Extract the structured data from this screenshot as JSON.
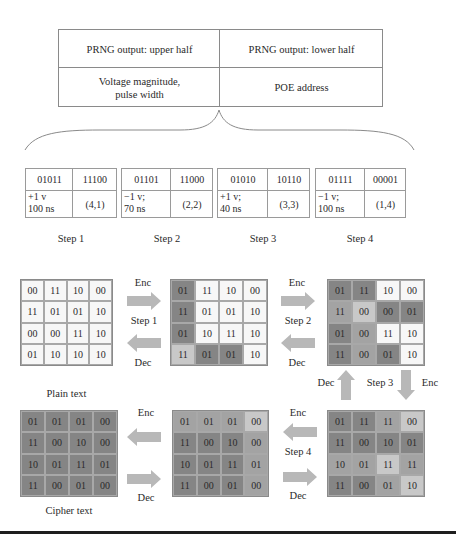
{
  "top_table": {
    "header": [
      "PRNG output: upper half",
      "PRNG output: lower half"
    ],
    "row": [
      "Voltage magnitude, pulse width",
      "POE address"
    ],
    "row_lines": [
      [
        "Voltage magnitude,",
        "pulse width"
      ],
      [
        "POE address"
      ]
    ]
  },
  "steps": [
    {
      "label": "Step 1",
      "upper": "01011",
      "lower": "11100",
      "voltage": "+1 v",
      "width": "100 ns",
      "address": "(4,1)"
    },
    {
      "label": "Step 2",
      "upper": "01101",
      "lower": "11000",
      "voltage": "−1 v;",
      "width": "70 ns",
      "address": "(2,2)"
    },
    {
      "label": "Step 3",
      "upper": "01010",
      "lower": "10110",
      "voltage": "+1 v;",
      "width": "40 ns",
      "address": "(3,3)"
    },
    {
      "label": "Step 4",
      "upper": "01111",
      "lower": "00001",
      "voltage": "−1 v;",
      "width": "100 ns",
      "address": "(1,4)"
    }
  ],
  "colors": {
    "white": "#f7f7f7",
    "light": "#c8c8c8",
    "mid": "#a3a3a3",
    "dark": "#858585",
    "arrow": "#b8b8b8",
    "border": "#8a8a8a"
  },
  "grids": {
    "plain": {
      "label": "Plain text",
      "values": [
        [
          "00",
          "11",
          "10",
          "00"
        ],
        [
          "11",
          "01",
          "01",
          "10"
        ],
        [
          "00",
          "00",
          "11",
          "10"
        ],
        [
          "01",
          "10",
          "10",
          "10"
        ]
      ],
      "shades": [
        [
          "w",
          "w",
          "w",
          "w"
        ],
        [
          "w",
          "w",
          "w",
          "w"
        ],
        [
          "w",
          "w",
          "w",
          "w"
        ],
        [
          "w",
          "w",
          "w",
          "w"
        ]
      ]
    },
    "after_step1": {
      "values": [
        [
          "01",
          "11",
          "10",
          "00"
        ],
        [
          "11",
          "01",
          "01",
          "10"
        ],
        [
          "01",
          "10",
          "11",
          "10"
        ],
        [
          "11",
          "01",
          "01",
          "10"
        ]
      ],
      "shades": [
        [
          "d",
          "w",
          "w",
          "w"
        ],
        [
          "d",
          "w",
          "w",
          "w"
        ],
        [
          "d",
          "w",
          "w",
          "w"
        ],
        [
          "l",
          "d",
          "d",
          "w"
        ]
      ]
    },
    "after_step2": {
      "values": [
        [
          "01",
          "11",
          "10",
          "00"
        ],
        [
          "11",
          "00",
          "00",
          "01"
        ],
        [
          "01",
          "00",
          "11",
          "10"
        ],
        [
          "11",
          "00",
          "01",
          "10"
        ]
      ],
      "shades": [
        [
          "d",
          "d",
          "w",
          "w"
        ],
        [
          "m",
          "l",
          "d",
          "d"
        ],
        [
          "d",
          "m",
          "w",
          "w"
        ],
        [
          "d",
          "m",
          "d",
          "w"
        ]
      ]
    },
    "after_step3": {
      "values": [
        [
          "01",
          "11",
          "11",
          "00"
        ],
        [
          "11",
          "00",
          "10",
          "01"
        ],
        [
          "10",
          "01",
          "11",
          "11"
        ],
        [
          "11",
          "00",
          "01",
          "10"
        ]
      ],
      "shades": [
        [
          "d",
          "d",
          "m",
          "l"
        ],
        [
          "d",
          "d",
          "d",
          "d"
        ],
        [
          "m",
          "m",
          "l",
          "m"
        ],
        [
          "d",
          "d",
          "m",
          "l"
        ]
      ]
    },
    "after_step4": {
      "values": [
        [
          "01",
          "01",
          "01",
          "00"
        ],
        [
          "11",
          "00",
          "10",
          "00"
        ],
        [
          "10",
          "01",
          "11",
          "01"
        ],
        [
          "11",
          "00",
          "01",
          "00"
        ]
      ],
      "shades": [
        [
          "m",
          "m",
          "m",
          "l"
        ],
        [
          "d",
          "d",
          "d",
          "m"
        ],
        [
          "d",
          "d",
          "d",
          "m"
        ],
        [
          "d",
          "d",
          "d",
          "m"
        ]
      ]
    },
    "cipher": {
      "label": "Cipher text",
      "values": [
        [
          "01",
          "01",
          "01",
          "00"
        ],
        [
          "11",
          "00",
          "10",
          "00"
        ],
        [
          "10",
          "01",
          "11",
          "01"
        ],
        [
          "11",
          "00",
          "01",
          "00"
        ]
      ],
      "shades": [
        [
          "d",
          "d",
          "d",
          "d"
        ],
        [
          "d",
          "d",
          "d",
          "d"
        ],
        [
          "d",
          "d",
          "d",
          "d"
        ],
        [
          "d",
          "d",
          "d",
          "d"
        ]
      ]
    }
  },
  "transitions": {
    "t1": {
      "enc": "Enc",
      "step": "Step 1",
      "dec": "Dec"
    },
    "t2": {
      "enc": "Enc",
      "step": "Step 2",
      "dec": "Dec"
    },
    "t3": {
      "enc": "Enc",
      "step": "Step 3",
      "dec": "Dec"
    },
    "t4": {
      "enc": "Enc",
      "step": "Step 4",
      "dec": "Dec"
    },
    "t5": {
      "enc": "Enc",
      "dec": "Dec"
    }
  }
}
